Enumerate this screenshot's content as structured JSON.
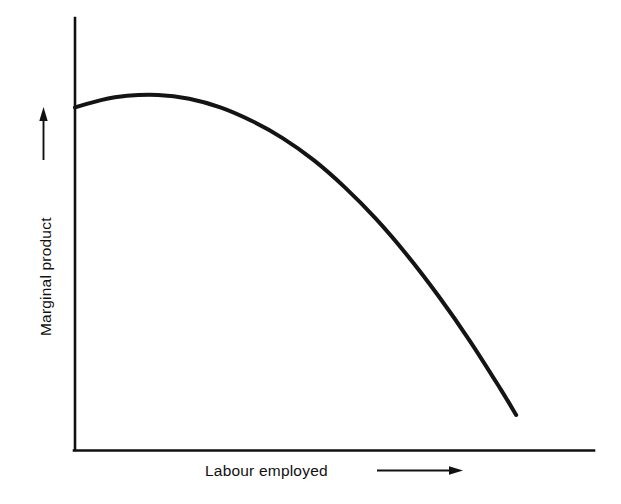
{
  "chart_data": {
    "type": "line",
    "title": "",
    "subtitle": "",
    "xlabel": "Labour employed",
    "ylabel": "Marginal product",
    "grid": false,
    "legend": null,
    "axis_arrows": {
      "x": "right-arrow",
      "y": "up-arrow"
    },
    "xlim": [
      0,
      100
    ],
    "ylim": [
      0,
      100
    ],
    "tick_labels": {
      "x": [],
      "y": []
    },
    "annotations": [],
    "series": [
      {
        "name": "Marginal product of labour",
        "x": [
          0,
          5,
          10,
          16,
          22,
          28,
          34,
          40,
          46,
          52,
          58,
          64,
          70,
          76,
          82,
          85
        ],
        "y": [
          79.3,
          81.0,
          82.0,
          82.2,
          81.3,
          79.3,
          76.2,
          72.2,
          67.1,
          60.8,
          53.5,
          45.1,
          35.7,
          25.4,
          14.1,
          8.1
        ],
        "color": "#141414",
        "linewidth": 4,
        "marker": "none"
      }
    ]
  },
  "axes": {
    "x_axis_name": "x-axis-line",
    "y_axis_name": "y-axis-line",
    "color": "#111111"
  },
  "colors": {
    "background": "#ffffff",
    "ink": "#111111",
    "curve": "#141414"
  }
}
